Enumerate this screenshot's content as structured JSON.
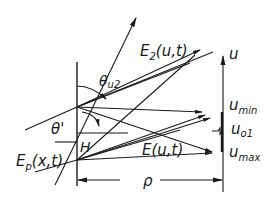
{
  "diagram": {
    "labels": {
      "e2": "E",
      "e2_sub": "2",
      "e2_args": "(u,t)",
      "theta_u2": "θ",
      "theta_u2_sub": "u2",
      "theta_prime": "θ'",
      "h": "H",
      "ep": "E",
      "ep_sub": "p",
      "ep_args": "(x,t)",
      "e": "E",
      "e_args": "(u,t)",
      "u_axis": "u",
      "u_min": "u",
      "u_min_sub": "min",
      "u_01": "u",
      "u_01_sub": "o1",
      "u_max": "u",
      "u_max_sub": "max",
      "rho": "ρ"
    },
    "colors": {
      "line": "#1a1a1a",
      "background": "#ffffff"
    }
  }
}
